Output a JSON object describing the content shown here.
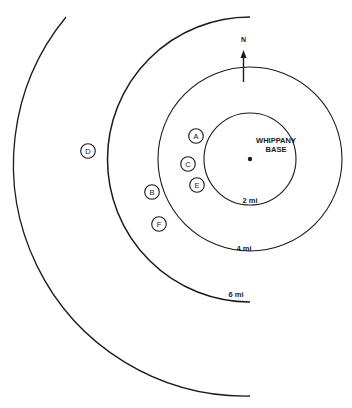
{
  "diagram": {
    "north_label": "N",
    "base_label_line1": "WHIPPANY",
    "base_label_line2": "BASE",
    "rings": [
      {
        "label": "2 mi"
      },
      {
        "label": "4 mi"
      },
      {
        "label": "6 mi"
      }
    ],
    "sites": [
      {
        "label": "A"
      },
      {
        "label": "B"
      },
      {
        "label": "C"
      },
      {
        "label": "D"
      },
      {
        "label": "E"
      },
      {
        "label": "F"
      }
    ],
    "colors": {
      "ink": "#1a1a1a",
      "paper": "#ffffff"
    }
  }
}
